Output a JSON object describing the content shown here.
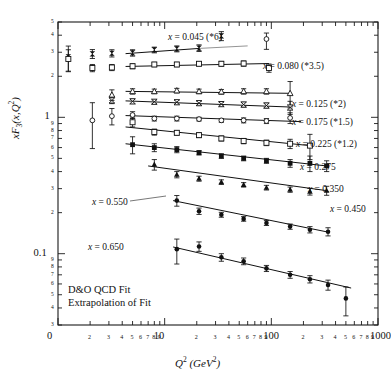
{
  "axes": {
    "x": {
      "title_html": "Q<sup>2</sup> (GeV<sup>2</sup>)",
      "title_text": "Q2 (GeV2)",
      "scale": "log",
      "min": 1,
      "max": 1000,
      "major_ticks": [
        "0",
        "10",
        "100",
        "1000"
      ],
      "major_values": [
        1,
        10,
        100,
        1000
      ],
      "minor_ticks": [
        "2",
        "3",
        "4",
        "5",
        "6",
        "7",
        "8",
        "9"
      ]
    },
    "y": {
      "title_html": "xF<sub>3</sub>(x,Q<sup>2</sup>)",
      "title_text": "xF3(x,Q2)",
      "scale": "log",
      "min": 0.03,
      "max": 5,
      "major_ticks": [
        "0.1",
        "1"
      ],
      "major_values": [
        0.1,
        1
      ],
      "minor_ticks": [
        "2",
        "3",
        "4",
        "5",
        "6",
        "7",
        "8",
        "9"
      ]
    }
  },
  "legend": {
    "line1": "D&O QCD Fit",
    "line2": "Extrapolation of Fit"
  },
  "chart_data": {
    "type": "scatter",
    "title": "",
    "xlabel": "Q2 (GeV2)",
    "ylabel": "xF3(x,Q2)",
    "xscale": "log",
    "yscale": "log",
    "xlim": [
      1,
      1000
    ],
    "ylim": [
      0.03,
      5
    ],
    "grid": false,
    "legend_position": "inside-lower-left",
    "annotations": [
      "D&O QCD Fit",
      "Extrapolation of Fit"
    ],
    "series": [
      {
        "name": "x = 0.045 (*6)",
        "x_value": 0.045,
        "scale_factor": 6,
        "marker": "filled-bowtie",
        "label_x": 168,
        "label_y": 33,
        "points": [
          {
            "x": 1.25,
            "y": 2.78,
            "err_lo": 0.62,
            "err_hi": 0.55,
            "detached": true
          },
          {
            "x": 2.1,
            "y": 2.92,
            "err_lo": 0.22,
            "err_hi": 0.22,
            "detached": true
          },
          {
            "x": 3.2,
            "y": 2.95,
            "err_lo": 0.18,
            "err_hi": 0.18,
            "detached": true
          },
          {
            "x": 5.0,
            "y": 2.97,
            "err_lo": 0.16,
            "err_hi": 0.16
          },
          {
            "x": 8.0,
            "y": 3.12,
            "err_lo": 0.15,
            "err_hi": 0.15
          },
          {
            "x": 13.0,
            "y": 3.18,
            "err_lo": 0.16,
            "err_hi": 0.16
          },
          {
            "x": 21.0,
            "y": 3.22,
            "err_lo": 0.18,
            "err_hi": 0.18
          },
          {
            "x": 34.0,
            "y": 3.95,
            "err_lo": 0.3,
            "err_hi": 0.3
          },
          {
            "x": 90.0,
            "y": 3.75,
            "err_lo": 0.6,
            "err_hi": 0.4,
            "open": true
          }
        ],
        "fit": {
          "x1": 4.3,
          "y1": 2.93,
          "x2": 21.0,
          "y2": 3.2
        },
        "extrapolation": {
          "x1": 21.0,
          "y1": 3.2,
          "x2": 60.0,
          "y2": 3.34
        }
      },
      {
        "name": "x = 0.080 (*3.5)",
        "x_value": 0.08,
        "scale_factor": 3.5,
        "marker": "open-square",
        "label_x": 263,
        "label_y": 62,
        "points": [
          {
            "x": 1.25,
            "y": 2.68,
            "err_lo": 0.5,
            "err_hi": 0.45,
            "detached": true
          },
          {
            "x": 2.1,
            "y": 2.3,
            "err_lo": 0.14,
            "err_hi": 0.14,
            "detached": true
          },
          {
            "x": 3.2,
            "y": 2.32,
            "err_lo": 0.12,
            "err_hi": 0.12,
            "detached": true
          },
          {
            "x": 5.0,
            "y": 2.37,
            "err_lo": 0.1,
            "err_hi": 0.1
          },
          {
            "x": 8.0,
            "y": 2.44,
            "err_lo": 0.09,
            "err_hi": 0.09
          },
          {
            "x": 13.0,
            "y": 2.44,
            "err_lo": 0.09,
            "err_hi": 0.09
          },
          {
            "x": 21.0,
            "y": 2.47,
            "err_lo": 0.09,
            "err_hi": 0.09
          },
          {
            "x": 34.0,
            "y": 2.47,
            "err_lo": 0.1,
            "err_hi": 0.1
          },
          {
            "x": 55.0,
            "y": 2.48,
            "err_lo": 0.11,
            "err_hi": 0.11
          },
          {
            "x": 95.0,
            "y": 2.3,
            "err_lo": 0.16,
            "err_hi": 0.16
          }
        ],
        "fit": {
          "x1": 4.3,
          "y1": 2.36,
          "x2": 95.0,
          "y2": 2.48
        }
      },
      {
        "name": "x = 0.125 (*2)",
        "x_value": 0.125,
        "scale_factor": 2,
        "marker": "open-triangle",
        "label_x": 292,
        "label_y": 100,
        "points": [
          {
            "x": 3.2,
            "y": 1.46,
            "err_lo": 0.13,
            "err_hi": 0.13,
            "detached": true
          },
          {
            "x": 5.0,
            "y": 1.55,
            "err_lo": 0.07,
            "err_hi": 0.07
          },
          {
            "x": 8.0,
            "y": 1.55,
            "err_lo": 0.06,
            "err_hi": 0.06
          },
          {
            "x": 13.0,
            "y": 1.57,
            "err_lo": 0.06,
            "err_hi": 0.06
          },
          {
            "x": 21.0,
            "y": 1.55,
            "err_lo": 0.06,
            "err_hi": 0.06
          },
          {
            "x": 34.0,
            "y": 1.54,
            "err_lo": 0.06,
            "err_hi": 0.06
          },
          {
            "x": 55.0,
            "y": 1.55,
            "err_lo": 0.07,
            "err_hi": 0.07
          },
          {
            "x": 90.0,
            "y": 1.55,
            "err_lo": 0.07,
            "err_hi": 0.07
          },
          {
            "x": 150.0,
            "y": 1.5,
            "err_lo": 0.33,
            "err_hi": 0.33
          }
        ],
        "fit": {
          "x1": 4.3,
          "y1": 1.55,
          "x2": 150.0,
          "y2": 1.5
        }
      },
      {
        "name": "x = 0.175 (*1.5)",
        "x_value": 0.175,
        "scale_factor": 1.5,
        "marker": "open-bowtie",
        "label_x": 292,
        "label_y": 118,
        "points": [
          {
            "x": 3.2,
            "y": 1.33,
            "err_lo": 0.07,
            "err_hi": 0.07,
            "detached": true
          },
          {
            "x": 5.0,
            "y": 1.31,
            "err_lo": 0.05,
            "err_hi": 0.05
          },
          {
            "x": 8.0,
            "y": 1.3,
            "err_lo": 0.04,
            "err_hi": 0.04
          },
          {
            "x": 13.0,
            "y": 1.29,
            "err_lo": 0.04,
            "err_hi": 0.04
          },
          {
            "x": 21.0,
            "y": 1.27,
            "err_lo": 0.04,
            "err_hi": 0.04
          },
          {
            "x": 34.0,
            "y": 1.25,
            "err_lo": 0.04,
            "err_hi": 0.04
          },
          {
            "x": 55.0,
            "y": 1.24,
            "err_lo": 0.05,
            "err_hi": 0.05
          },
          {
            "x": 90.0,
            "y": 1.22,
            "err_lo": 0.05,
            "err_hi": 0.05
          },
          {
            "x": 150.0,
            "y": 1.18,
            "err_lo": 0.13,
            "err_hi": 0.13
          }
        ],
        "fit": {
          "x1": 4.3,
          "y1": 1.32,
          "x2": 150.0,
          "y2": 1.19
        }
      },
      {
        "name": "x = 0.225 (*1.2)",
        "x_value": 0.225,
        "scale_factor": 1.2,
        "marker": "open-circle",
        "label_x": 296,
        "label_y": 140,
        "points": [
          {
            "x": 2.1,
            "y": 0.95,
            "err_lo": 0.36,
            "err_hi": 0.33,
            "detached": true
          },
          {
            "x": 3.2,
            "y": 1.02,
            "err_lo": 0.14,
            "err_hi": 0.14,
            "detached": true
          },
          {
            "x": 5.0,
            "y": 1.04,
            "err_lo": 0.06,
            "err_hi": 0.06
          },
          {
            "x": 8.0,
            "y": 0.98,
            "err_lo": 0.04,
            "err_hi": 0.04
          },
          {
            "x": 13.0,
            "y": 0.98,
            "err_lo": 0.04,
            "err_hi": 0.04
          },
          {
            "x": 21.0,
            "y": 0.97,
            "err_lo": 0.03,
            "err_hi": 0.03
          },
          {
            "x": 34.0,
            "y": 0.95,
            "err_lo": 0.03,
            "err_hi": 0.03
          },
          {
            "x": 55.0,
            "y": 0.95,
            "err_lo": 0.04,
            "err_hi": 0.04
          },
          {
            "x": 90.0,
            "y": 0.94,
            "err_lo": 0.04,
            "err_hi": 0.04
          },
          {
            "x": 150.0,
            "y": 0.99,
            "err_lo": 0.09,
            "err_hi": 0.09
          }
        ],
        "fit": {
          "x1": 4.3,
          "y1": 1.03,
          "x2": 190.0,
          "y2": 0.93
        }
      },
      {
        "name": "x = 0.275",
        "x_value": 0.275,
        "scale_factor": 1,
        "marker": "open-square",
        "label_x": 300,
        "label_y": 163,
        "points": [
          {
            "x": 5.0,
            "y": 0.92,
            "err_lo": 0.07,
            "err_hi": 0.07
          },
          {
            "x": 8.0,
            "y": 0.78,
            "err_lo": 0.04,
            "err_hi": 0.04
          },
          {
            "x": 13.0,
            "y": 0.77,
            "err_lo": 0.03,
            "err_hi": 0.03
          },
          {
            "x": 21.0,
            "y": 0.74,
            "err_lo": 0.03,
            "err_hi": 0.03
          },
          {
            "x": 34.0,
            "y": 0.7,
            "err_lo": 0.03,
            "err_hi": 0.03
          },
          {
            "x": 55.0,
            "y": 0.67,
            "err_lo": 0.03,
            "err_hi": 0.03
          },
          {
            "x": 90.0,
            "y": 0.65,
            "err_lo": 0.03,
            "err_hi": 0.03
          },
          {
            "x": 150.0,
            "y": 0.64,
            "err_lo": 0.05,
            "err_hi": 0.05
          },
          {
            "x": 230.0,
            "y": 0.62,
            "err_lo": 0.13,
            "err_hi": 0.13
          }
        ],
        "fit": {
          "x1": 4.3,
          "y1": 0.85,
          "x2": 230.0,
          "y2": 0.62
        }
      },
      {
        "name": "x = 0.350",
        "x_value": 0.35,
        "scale_factor": 1,
        "marker": "filled-square",
        "label_x": 308,
        "label_y": 185,
        "points": [
          {
            "x": 5.0,
            "y": 0.63,
            "err_lo": 0.09,
            "err_hi": 0.09
          },
          {
            "x": 8.0,
            "y": 0.6,
            "err_lo": 0.04,
            "err_hi": 0.04
          },
          {
            "x": 13.0,
            "y": 0.58,
            "err_lo": 0.03,
            "err_hi": 0.03
          },
          {
            "x": 21.0,
            "y": 0.55,
            "err_lo": 0.02,
            "err_hi": 0.02
          },
          {
            "x": 34.0,
            "y": 0.52,
            "err_lo": 0.02,
            "err_hi": 0.02
          },
          {
            "x": 55.0,
            "y": 0.5,
            "err_lo": 0.02,
            "err_hi": 0.02
          },
          {
            "x": 90.0,
            "y": 0.48,
            "err_lo": 0.02,
            "err_hi": 0.02
          },
          {
            "x": 150.0,
            "y": 0.46,
            "err_lo": 0.03,
            "err_hi": 0.03
          },
          {
            "x": 230.0,
            "y": 0.46,
            "err_lo": 0.06,
            "err_hi": 0.06
          },
          {
            "x": 330.0,
            "y": 0.44,
            "err_lo": 0.04,
            "err_hi": 0.04
          }
        ],
        "fit": {
          "x1": 4.3,
          "y1": 0.64,
          "x2": 330.0,
          "y2": 0.44
        }
      },
      {
        "name": "x = 0.450",
        "x_value": 0.45,
        "scale_factor": 1,
        "marker": "filled-triangle",
        "label_x": 330,
        "label_y": 205,
        "points": [
          {
            "x": 8.0,
            "y": 0.45,
            "err_lo": 0.04,
            "err_hi": 0.04
          },
          {
            "x": 13.0,
            "y": 0.38,
            "err_lo": 0.02,
            "err_hi": 0.02
          },
          {
            "x": 21.0,
            "y": 0.355,
            "err_lo": 0.015,
            "err_hi": 0.015
          },
          {
            "x": 34.0,
            "y": 0.335,
            "err_lo": 0.013,
            "err_hi": 0.013
          },
          {
            "x": 55.0,
            "y": 0.32,
            "err_lo": 0.012,
            "err_hi": 0.012
          },
          {
            "x": 90.0,
            "y": 0.305,
            "err_lo": 0.012,
            "err_hi": 0.012
          },
          {
            "x": 150.0,
            "y": 0.295,
            "err_lo": 0.013,
            "err_hi": 0.013
          },
          {
            "x": 230.0,
            "y": 0.285,
            "err_lo": 0.016,
            "err_hi": 0.016
          },
          {
            "x": 330.0,
            "y": 0.29,
            "err_lo": 0.022,
            "err_hi": 0.022
          }
        ],
        "fit": {
          "x1": 7.0,
          "y1": 0.44,
          "x2": 330.0,
          "y2": 0.29
        }
      },
      {
        "name": "x = 0.550",
        "x_value": 0.55,
        "scale_factor": 1,
        "marker": "filled-circle",
        "label_x": 92,
        "label_y": 198,
        "points": [
          {
            "x": 13.0,
            "y": 0.245,
            "err_lo": 0.022,
            "err_hi": 0.022
          },
          {
            "x": 21.0,
            "y": 0.205,
            "err_lo": 0.011,
            "err_hi": 0.011
          },
          {
            "x": 34.0,
            "y": 0.193,
            "err_lo": 0.008,
            "err_hi": 0.008
          },
          {
            "x": 55.0,
            "y": 0.18,
            "err_lo": 0.007,
            "err_hi": 0.007
          },
          {
            "x": 90.0,
            "y": 0.168,
            "err_lo": 0.007,
            "err_hi": 0.007
          },
          {
            "x": 150.0,
            "y": 0.158,
            "err_lo": 0.007,
            "err_hi": 0.007
          },
          {
            "x": 230.0,
            "y": 0.15,
            "err_lo": 0.008,
            "err_hi": 0.008
          },
          {
            "x": 340.0,
            "y": 0.145,
            "err_lo": 0.01,
            "err_hi": 0.01
          }
        ],
        "fit": {
          "x1": 12.0,
          "y1": 0.245,
          "x2": 340.0,
          "y2": 0.144
        },
        "leader": {
          "x1": 130,
          "y1": 201,
          "x2": 166,
          "y2": 196
        }
      },
      {
        "name": "x = 0.650",
        "x_value": 0.65,
        "scale_factor": 1,
        "marker": "filled-circle",
        "label_x": 88,
        "label_y": 243,
        "points": [
          {
            "x": 13.0,
            "y": 0.108,
            "err_lo": 0.024,
            "err_hi": 0.02
          },
          {
            "x": 21.0,
            "y": 0.113,
            "err_lo": 0.009,
            "err_hi": 0.009
          },
          {
            "x": 34.0,
            "y": 0.094,
            "err_lo": 0.006,
            "err_hi": 0.006
          },
          {
            "x": 55.0,
            "y": 0.088,
            "err_lo": 0.005,
            "err_hi": 0.005
          },
          {
            "x": 90.0,
            "y": 0.078,
            "err_lo": 0.004,
            "err_hi": 0.004
          },
          {
            "x": 150.0,
            "y": 0.07,
            "err_lo": 0.004,
            "err_hi": 0.004
          },
          {
            "x": 230.0,
            "y": 0.065,
            "err_lo": 0.004,
            "err_hi": 0.004
          },
          {
            "x": 340.0,
            "y": 0.059,
            "err_lo": 0.005,
            "err_hi": 0.005
          },
          {
            "x": 500.0,
            "y": 0.047,
            "err_lo": 0.012,
            "err_hi": 0.01
          }
        ],
        "fit": {
          "x1": 12.0,
          "y1": 0.112,
          "x2": 560.0,
          "y2": 0.056
        }
      }
    ]
  }
}
